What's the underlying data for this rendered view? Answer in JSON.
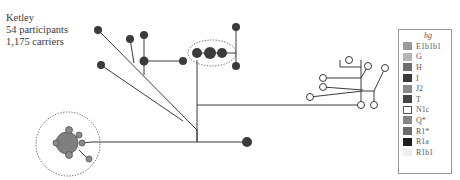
{
  "caption": {
    "place": "Ketley",
    "participants": "54 participants",
    "carriers": "1,175 carriers"
  },
  "legend": {
    "title": "hg",
    "items": [
      {
        "label": "E1b1b1",
        "color": "#9a9a9a"
      },
      {
        "label": "G",
        "color": "#b5b5b5"
      },
      {
        "label": "H",
        "color": "#6e6e6e"
      },
      {
        "label": "I",
        "color": "#3a3a3a"
      },
      {
        "label": "J2",
        "color": "#8a8a8a"
      },
      {
        "label": "T",
        "color": "#444444"
      },
      {
        "label": "N1c",
        "color": "#ffffff"
      },
      {
        "label": "Q*",
        "color": "#858585"
      },
      {
        "label": "R1*",
        "color": "#6a6a6a"
      },
      {
        "label": "R1a",
        "color": "#1e1e1e"
      },
      {
        "label": "R1b1",
        "color": "#efefef"
      }
    ]
  },
  "network": {
    "colors": {
      "dark": "#3b3b3b",
      "mid": "#7d7d7d",
      "open": "#ffffff",
      "edge": "#3a3a3a"
    }
  }
}
